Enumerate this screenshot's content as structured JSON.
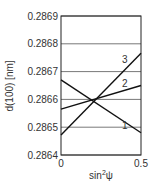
{
  "chart_data": {
    "type": "line",
    "title": "",
    "xlabel": "sin²ψ",
    "xlabel_base": "sin",
    "xlabel_sup": "2",
    "xlabel_tail": "ψ",
    "ylabel": "d(100) [nm]",
    "xlim": [
      0,
      0.5
    ],
    "ylim": [
      0.2864,
      0.2869
    ],
    "x_ticks": [
      "0",
      "0.5"
    ],
    "y_ticks": [
      "0.2869",
      "0.2868",
      "0.2867",
      "0.2866",
      "0.2865",
      "0.2864"
    ],
    "grid": "horizontal",
    "legend": "inline labels",
    "series": [
      {
        "name": "1",
        "x": [
          0,
          0.5
        ],
        "values": [
          0.28667,
          0.28648
        ]
      },
      {
        "name": "2",
        "x": [
          0,
          0.5
        ],
        "values": [
          0.286565,
          0.28665
        ]
      },
      {
        "name": "3",
        "x": [
          0,
          0.5
        ],
        "values": [
          0.286472,
          0.286766
        ]
      }
    ]
  }
}
